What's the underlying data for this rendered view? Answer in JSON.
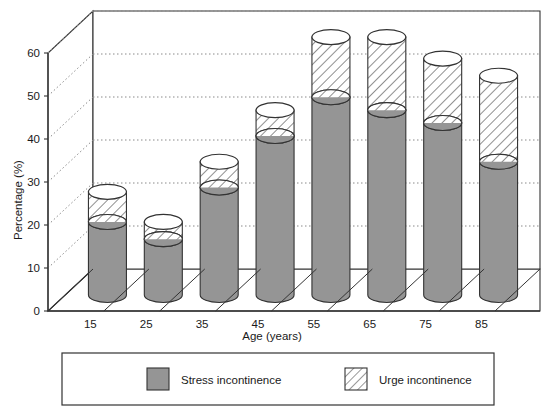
{
  "chart_data": {
    "type": "bar",
    "subtype": "stacked-3d-cylinder",
    "title": "",
    "xlabel": "Age (years)",
    "ylabel": "Percentage (%)",
    "categories": [
      "15",
      "25",
      "35",
      "45",
      "55",
      "65",
      "75",
      "85"
    ],
    "series": [
      {
        "name": "Stress incontinence",
        "fill": "#959595",
        "pattern": "solid",
        "values": [
          17,
          13,
          25,
          37,
          46,
          43,
          40,
          31
        ]
      },
      {
        "name": "Urge incontinence",
        "fill": "#ffffff",
        "pattern": "diagonal-hatch",
        "values": [
          7,
          4,
          6,
          6,
          14,
          17,
          15,
          20
        ]
      }
    ],
    "totals": [
      24,
      17,
      31,
      43,
      60,
      60,
      55,
      51
    ],
    "ylim": [
      0,
      60
    ],
    "yticks": [
      0,
      10,
      20,
      30,
      40,
      50,
      60
    ],
    "ytick_labels": [
      "0",
      "10",
      "20",
      "30",
      "40",
      "50",
      "60"
    ],
    "xtick_labels": [
      "15",
      "25",
      "35",
      "45",
      "55",
      "65",
      "75",
      "85"
    ],
    "grid": true,
    "grid_style": "dotted",
    "legend_position": "bottom",
    "legend_entries": [
      "Stress incontinence",
      "Urge incontinence"
    ]
  },
  "axes": {
    "y_title": "Percentage (%)",
    "x_title": "Age (years)"
  },
  "legend": {
    "stress_label": "Stress incontinence",
    "urge_label": "Urge incontinence"
  },
  "colors": {
    "bar_gray": "#959595",
    "outline": "#333333",
    "grid": "#8a8a8a",
    "text": "#1a1a1a",
    "background": "#ffffff"
  }
}
